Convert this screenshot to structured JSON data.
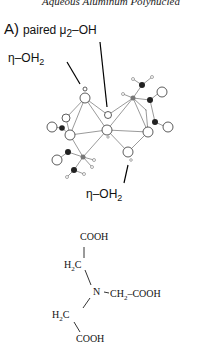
{
  "header": {
    "running_title": "Aqueous Aluminum Polynuclea"
  },
  "figure": {
    "panel_letter": "A)",
    "labels": {
      "paired_prefix": "paired μ",
      "paired_sub": "2",
      "paired_suffix": "–OH",
      "eta_top_prefix": "η–OH",
      "eta_top_sub": "2",
      "eta_bottom_prefix": "η–OH",
      "eta_bottom_sub": "2"
    },
    "structure": {
      "top": "COOH",
      "ch2_upper_h": "H",
      "ch2_upper_sub": "2",
      "ch2_upper_c": "C",
      "nitrogen": "N",
      "right_chain_a": "CH",
      "right_chain_sub": "2",
      "right_chain_b": "–COOH",
      "ch2_lower_h": "H",
      "ch2_lower_sub": "2",
      "ch2_lower_c": "C",
      "bottom": "COOH"
    }
  }
}
